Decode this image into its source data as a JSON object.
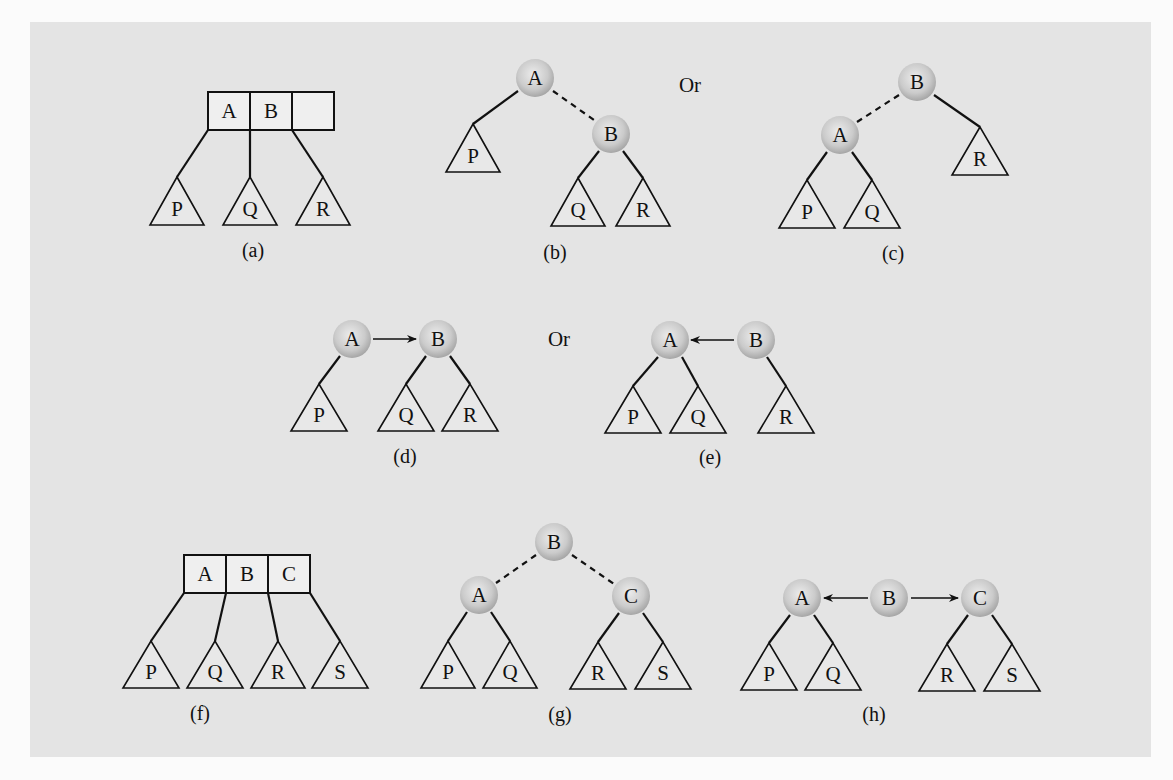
{
  "figure": {
    "or_labels": [
      {
        "text": "Or",
        "x": 690,
        "y": 92
      },
      {
        "text": "Or",
        "x": 559,
        "y": 346
      }
    ],
    "colors": {
      "panel": "#e4e4e4",
      "node_fill_center": "#e6e6e6",
      "node_fill_edge": "#a9a9a9",
      "stroke": "#111111"
    },
    "subfigures": [
      {
        "id": "a",
        "caption": "(a)",
        "caption_pos": [
          253,
          257
        ],
        "box": {
          "x": 208,
          "y": 92,
          "cell_w": 42,
          "h": 38,
          "cells": [
            "A",
            "B",
            ""
          ]
        },
        "subtrees": [
          {
            "label": "P",
            "apex": [
              177,
              177
            ],
            "half": 27,
            "h": 48
          },
          {
            "label": "Q",
            "apex": [
              250,
              177
            ],
            "half": 27,
            "h": 48
          },
          {
            "label": "R",
            "apex": [
              323,
              177
            ],
            "half": 27,
            "h": 48
          }
        ],
        "edges": [
          {
            "from": [
              208,
              130
            ],
            "to": [
              177,
              177
            ],
            "style": "solid"
          },
          {
            "from": [
              250,
              130
            ],
            "to": [
              250,
              177
            ],
            "style": "solid"
          },
          {
            "from": [
              292,
              130
            ],
            "to": [
              323,
              177
            ],
            "style": "solid"
          }
        ]
      },
      {
        "id": "b",
        "caption": "(b)",
        "caption_pos": [
          555,
          259
        ],
        "nodes": [
          {
            "label": "A",
            "cx": 535,
            "cy": 78
          },
          {
            "label": "B",
            "cx": 611,
            "cy": 134
          }
        ],
        "subtrees": [
          {
            "label": "P",
            "apex": [
              473,
              124
            ],
            "half": 27,
            "h": 48
          },
          {
            "label": "Q",
            "apex": [
              578,
              178
            ],
            "half": 27,
            "h": 48
          },
          {
            "label": "R",
            "apex": [
              643,
              178
            ],
            "half": 27,
            "h": 48
          }
        ],
        "edges": [
          {
            "from": [
              518,
              91
            ],
            "to": [
              473,
              124
            ],
            "style": "solid"
          },
          {
            "from": [
              553,
              91
            ],
            "to": [
              594,
              120
            ],
            "style": "dashed"
          },
          {
            "from": [
              599,
              151
            ],
            "to": [
              578,
              178
            ],
            "style": "solid"
          },
          {
            "from": [
              623,
              151
            ],
            "to": [
              643,
              178
            ],
            "style": "solid"
          }
        ]
      },
      {
        "id": "c",
        "caption": "(c)",
        "caption_pos": [
          893,
          260
        ],
        "nodes": [
          {
            "label": "B",
            "cx": 917,
            "cy": 82
          },
          {
            "label": "A",
            "cx": 840,
            "cy": 135
          }
        ],
        "subtrees": [
          {
            "label": "R",
            "apex": [
              980,
              127
            ],
            "half": 28,
            "h": 48
          },
          {
            "label": "P",
            "apex": [
              807,
              180
            ],
            "half": 28,
            "h": 48
          },
          {
            "label": "Q",
            "apex": [
              872,
              180
            ],
            "half": 28,
            "h": 48
          }
        ],
        "edges": [
          {
            "from": [
              899,
              95
            ],
            "to": [
              857,
              122
            ],
            "style": "dashed"
          },
          {
            "from": [
              934,
              95
            ],
            "to": [
              980,
              127
            ],
            "style": "solid"
          },
          {
            "from": [
              827,
              152
            ],
            "to": [
              807,
              180
            ],
            "style": "solid"
          },
          {
            "from": [
              852,
              152
            ],
            "to": [
              872,
              180
            ],
            "style": "solid"
          }
        ]
      },
      {
        "id": "d",
        "caption": "(d)",
        "caption_pos": [
          405,
          463
        ],
        "nodes": [
          {
            "label": "A",
            "cx": 352,
            "cy": 339
          },
          {
            "label": "B",
            "cx": 438,
            "cy": 339
          }
        ],
        "arrows": [
          {
            "from": [
              373,
              339
            ],
            "to": [
              416,
              339
            ]
          }
        ],
        "subtrees": [
          {
            "label": "P",
            "apex": [
              319,
              384
            ],
            "half": 28,
            "h": 47
          },
          {
            "label": "Q",
            "apex": [
              406,
              384
            ],
            "half": 28,
            "h": 47
          },
          {
            "label": "R",
            "apex": [
              470,
              384
            ],
            "half": 28,
            "h": 47
          }
        ],
        "edges": [
          {
            "from": [
              340,
              356
            ],
            "to": [
              319,
              384
            ],
            "style": "solid"
          },
          {
            "from": [
              426,
              356
            ],
            "to": [
              406,
              384
            ],
            "style": "solid"
          },
          {
            "from": [
              450,
              356
            ],
            "to": [
              470,
              384
            ],
            "style": "solid"
          }
        ]
      },
      {
        "id": "e",
        "caption": "(e)",
        "caption_pos": [
          710,
          464
        ],
        "nodes": [
          {
            "label": "A",
            "cx": 670,
            "cy": 340
          },
          {
            "label": "B",
            "cx": 756,
            "cy": 340
          }
        ],
        "arrows": [
          {
            "from": [
              734,
              340
            ],
            "to": [
              691,
              340
            ]
          }
        ],
        "subtrees": [
          {
            "label": "P",
            "apex": [
              633,
              386
            ],
            "half": 28,
            "h": 47
          },
          {
            "label": "Q",
            "apex": [
              698,
              386
            ],
            "half": 28,
            "h": 47
          },
          {
            "label": "R",
            "apex": [
              786,
              386
            ],
            "half": 28,
            "h": 47
          }
        ],
        "edges": [
          {
            "from": [
              658,
              357
            ],
            "to": [
              633,
              386
            ],
            "style": "solid"
          },
          {
            "from": [
              682,
              357
            ],
            "to": [
              698,
              386
            ],
            "style": "solid"
          },
          {
            "from": [
              767,
              357
            ],
            "to": [
              786,
              386
            ],
            "style": "solid"
          }
        ]
      },
      {
        "id": "f",
        "caption": "(f)",
        "caption_pos": [
          200,
          720
        ],
        "box": {
          "x": 184,
          "y": 555,
          "cell_w": 42,
          "h": 38,
          "cells": [
            "A",
            "B",
            "C"
          ]
        },
        "subtrees": [
          {
            "label": "P",
            "apex": [
              151,
              641
            ],
            "half": 28,
            "h": 47
          },
          {
            "label": "Q",
            "apex": [
              215,
              641
            ],
            "half": 28,
            "h": 47
          },
          {
            "label": "R",
            "apex": [
              278,
              641
            ],
            "half": 27,
            "h": 47
          },
          {
            "label": "S",
            "apex": [
              340,
              641
            ],
            "half": 28,
            "h": 47
          }
        ],
        "edges": [
          {
            "from": [
              184,
              593
            ],
            "to": [
              151,
              641
            ],
            "style": "solid"
          },
          {
            "from": [
              226,
              593
            ],
            "to": [
              215,
              641
            ],
            "style": "solid"
          },
          {
            "from": [
              268,
              593
            ],
            "to": [
              278,
              641
            ],
            "style": "solid"
          },
          {
            "from": [
              310,
              593
            ],
            "to": [
              340,
              641
            ],
            "style": "solid"
          }
        ]
      },
      {
        "id": "g",
        "caption": "(g)",
        "caption_pos": [
          560,
          721
        ],
        "nodes": [
          {
            "label": "B",
            "cx": 554,
            "cy": 542
          },
          {
            "label": "A",
            "cx": 479,
            "cy": 595
          },
          {
            "label": "C",
            "cx": 631,
            "cy": 596
          }
        ],
        "subtrees": [
          {
            "label": "P",
            "apex": [
              448,
              641
            ],
            "half": 27,
            "h": 47
          },
          {
            "label": "Q",
            "apex": [
              510,
              641
            ],
            "half": 27,
            "h": 47
          },
          {
            "label": "R",
            "apex": [
              598,
              642
            ],
            "half": 28,
            "h": 47
          },
          {
            "label": "S",
            "apex": [
              663,
              642
            ],
            "half": 28,
            "h": 47
          }
        ],
        "edges": [
          {
            "from": [
              536,
              555
            ],
            "to": [
              496,
              583
            ],
            "style": "dashed"
          },
          {
            "from": [
              572,
              555
            ],
            "to": [
              614,
              584
            ],
            "style": "dashed"
          },
          {
            "from": [
              467,
              612
            ],
            "to": [
              448,
              641
            ],
            "style": "solid"
          },
          {
            "from": [
              491,
              612
            ],
            "to": [
              510,
              641
            ],
            "style": "solid"
          },
          {
            "from": [
              619,
              613
            ],
            "to": [
              598,
              642
            ],
            "style": "solid"
          },
          {
            "from": [
              643,
              613
            ],
            "to": [
              663,
              642
            ],
            "style": "solid"
          }
        ]
      },
      {
        "id": "h",
        "caption": "(h)",
        "caption_pos": [
          874,
          721
        ],
        "nodes": [
          {
            "label": "A",
            "cx": 802,
            "cy": 598
          },
          {
            "label": "B",
            "cx": 889,
            "cy": 598
          },
          {
            "label": "C",
            "cx": 980,
            "cy": 598
          }
        ],
        "arrows": [
          {
            "from": [
              868,
              598
            ],
            "to": [
              824,
              598
            ]
          },
          {
            "from": [
              911,
              598
            ],
            "to": [
              958,
              598
            ]
          }
        ],
        "subtrees": [
          {
            "label": "P",
            "apex": [
              769,
              643
            ],
            "half": 28,
            "h": 47
          },
          {
            "label": "Q",
            "apex": [
              833,
              643
            ],
            "half": 28,
            "h": 47
          },
          {
            "label": "R",
            "apex": [
              947,
              644
            ],
            "half": 28,
            "h": 47
          },
          {
            "label": "S",
            "apex": [
              1012,
              644
            ],
            "half": 28,
            "h": 47
          }
        ],
        "edges": [
          {
            "from": [
              790,
              615
            ],
            "to": [
              769,
              643
            ],
            "style": "solid"
          },
          {
            "from": [
              814,
              615
            ],
            "to": [
              833,
              643
            ],
            "style": "solid"
          },
          {
            "from": [
              968,
              615
            ],
            "to": [
              947,
              644
            ],
            "style": "solid"
          },
          {
            "from": [
              992,
              615
            ],
            "to": [
              1012,
              644
            ],
            "style": "solid"
          }
        ]
      }
    ]
  }
}
